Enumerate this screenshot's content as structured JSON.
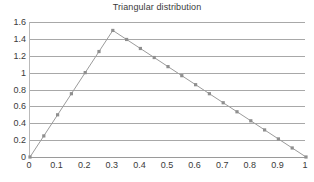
{
  "chart_data": {
    "type": "line",
    "title": "Triangular distribution",
    "xlabel": "",
    "ylabel": "",
    "xlim": [
      0,
      1
    ],
    "ylim": [
      0,
      1.6
    ],
    "grid": true,
    "legend": false,
    "legend_position": "none",
    "line_color": "#9b9b9b",
    "marker_color": "#8f8f8f",
    "marker": "square",
    "gridline_color": "#a8a8a8",
    "text_color": "#3a3a3a",
    "background": "#ffffff",
    "x_tick_labels": [
      "0",
      "0.1",
      "0.2",
      "0.3",
      "0.4",
      "0.5",
      "0.6",
      "0.7",
      "0.8",
      "0.9",
      "1"
    ],
    "x_tick_values": [
      0,
      0.1,
      0.2,
      0.3,
      0.4,
      0.5,
      0.6,
      0.7,
      0.8,
      0.9,
      1
    ],
    "y_tick_labels": [
      "0",
      "0.2",
      "0.4",
      "0.6",
      "0.8",
      "1",
      "1.2",
      "1.4",
      "1.6"
    ],
    "y_tick_values": [
      0,
      0.2,
      0.4,
      0.6,
      0.8,
      1,
      1.2,
      1.4,
      1.6
    ],
    "series": [
      {
        "name": "Triangular PDF",
        "x": [
          0,
          0.05,
          0.1,
          0.15,
          0.2,
          0.25,
          0.3,
          0.35,
          0.4,
          0.45,
          0.5,
          0.55,
          0.6,
          0.65,
          0.7,
          0.75,
          0.8,
          0.85,
          0.9,
          0.95,
          1
        ],
        "values": [
          0,
          0.25,
          0.5,
          0.75,
          1.0,
          1.25,
          1.5,
          1.393,
          1.286,
          1.179,
          1.071,
          0.964,
          0.857,
          0.75,
          0.643,
          0.536,
          0.429,
          0.321,
          0.214,
          0.107,
          0
        ]
      }
    ]
  }
}
